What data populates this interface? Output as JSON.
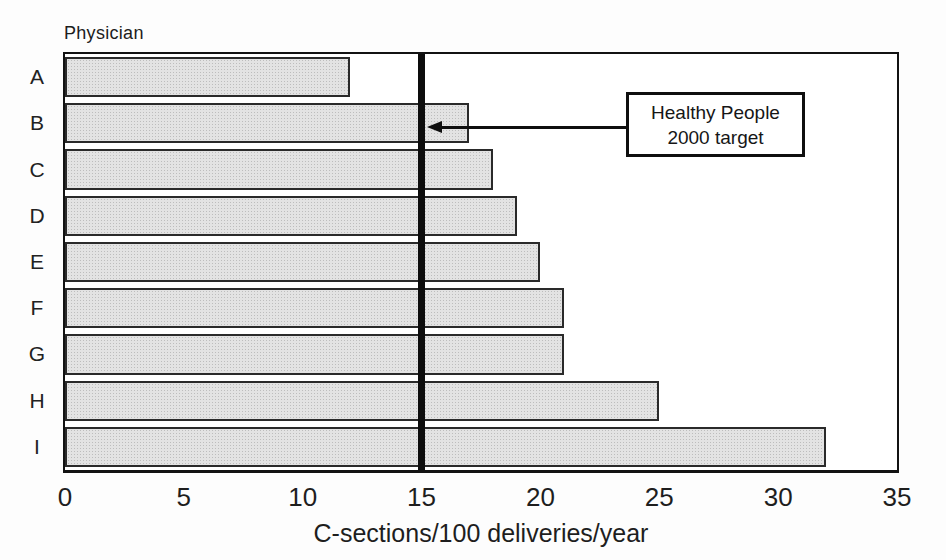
{
  "figure": {
    "background": "#fdfdfd"
  },
  "chart_data": {
    "type": "bar",
    "orientation": "horizontal",
    "title": "Physician",
    "categories": [
      "A",
      "B",
      "C",
      "D",
      "E",
      "F",
      "G",
      "H",
      "I"
    ],
    "values": [
      12,
      17,
      18,
      19,
      20,
      21,
      21,
      25,
      32
    ],
    "xlabel": "C-sections/100 deliveries/year",
    "xlim": [
      0,
      35
    ],
    "xticks": [
      0,
      5,
      10,
      15,
      20,
      25,
      30,
      35
    ],
    "grid": false,
    "legend": "none",
    "reference_line": {
      "value": 15,
      "label": "Healthy People 2000 target"
    },
    "colors": {
      "bar_fill": "#e3e3e3",
      "bar_dot": "#bdbdbd",
      "bar_border": "#2a2a2a",
      "axis": "#121212",
      "reference_line": "#0d0d0d"
    }
  },
  "annotation": {
    "line1": "Healthy People",
    "line2": "2000 target"
  }
}
